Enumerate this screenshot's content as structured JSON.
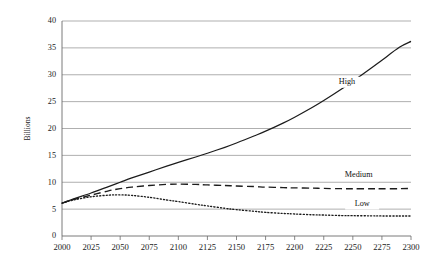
{
  "chart_data": {
    "type": "line",
    "title": "",
    "xlabel": "",
    "ylabel": "Billions",
    "xlim": [
      2000,
      2300
    ],
    "ylim": [
      0,
      40
    ],
    "grid": true,
    "legend_position": "inline-right",
    "x_ticks": [
      2000,
      2025,
      2050,
      2075,
      2100,
      2125,
      2150,
      2175,
      2200,
      2225,
      2250,
      2275,
      2300
    ],
    "y_ticks": [
      0,
      5,
      10,
      15,
      20,
      25,
      30,
      35,
      40
    ],
    "x": [
      2000,
      2010,
      2025,
      2040,
      2050,
      2060,
      2075,
      2090,
      2100,
      2115,
      2125,
      2140,
      2150,
      2165,
      2175,
      2190,
      2200,
      2215,
      2225,
      2240,
      2250,
      2265,
      2275,
      2290,
      2300
    ],
    "series": [
      {
        "name": "High",
        "label": "High",
        "style": "solid",
        "values": [
          6.1,
          6.9,
          8.0,
          9.2,
          10.0,
          10.8,
          11.9,
          13.0,
          13.7,
          14.7,
          15.4,
          16.5,
          17.3,
          18.6,
          19.5,
          21.0,
          22.1,
          23.9,
          25.2,
          27.3,
          28.8,
          31.1,
          32.7,
          35.1,
          36.2
        ]
      },
      {
        "name": "Medium",
        "label": "Medium",
        "style": "dashed",
        "values": [
          6.1,
          6.8,
          7.6,
          8.4,
          8.8,
          9.1,
          9.4,
          9.6,
          9.65,
          9.6,
          9.5,
          9.4,
          9.3,
          9.2,
          9.1,
          9.0,
          8.95,
          8.9,
          8.85,
          8.8,
          8.8,
          8.8,
          8.8,
          8.8,
          8.85
        ]
      },
      {
        "name": "Low",
        "label": "Low",
        "style": "dotted",
        "values": [
          6.1,
          6.7,
          7.3,
          7.6,
          7.65,
          7.55,
          7.2,
          6.7,
          6.4,
          5.9,
          5.6,
          5.15,
          4.9,
          4.6,
          4.4,
          4.2,
          4.1,
          3.95,
          3.9,
          3.8,
          3.78,
          3.75,
          3.73,
          3.72,
          3.72
        ]
      }
    ],
    "annotations": [
      {
        "text": "High",
        "x": 2245,
        "y": 28.6
      },
      {
        "text": "Medium",
        "x": 2255,
        "y": 11.3
      },
      {
        "text": "Low",
        "x": 2258,
        "y": 5.95
      }
    ],
    "colors": {
      "line": "#1c1c1c",
      "grid": "#8c8c8c",
      "axis": "#6b6b6b",
      "text": "#1a1a1a",
      "background": "#ffffff"
    }
  }
}
